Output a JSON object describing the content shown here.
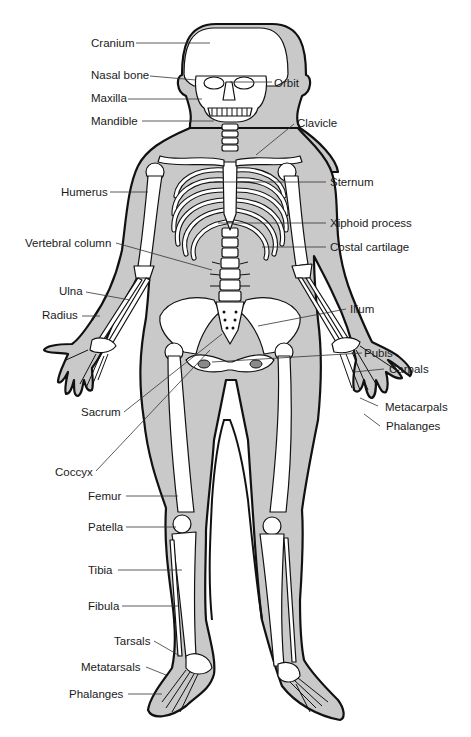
{
  "diagram": {
    "colors": {
      "body_fill": "#c9c9c9",
      "outline": "#111111",
      "bone": "#ffffff",
      "text": "#1a1a1a"
    },
    "labels": {
      "cranium": "Cranium",
      "nasal_bone": "Nasal bone",
      "orbit": "Orbit",
      "maxilla": "Maxilla",
      "mandible": "Mandible",
      "clavicle": "Clavicle",
      "humerus": "Humerus",
      "sternum": "Sternum",
      "xiphoid_process": "Xiphoid process",
      "vertebral_column": "Vertebral column",
      "costal_cartilage": "Costal cartilage",
      "ulna": "Ulna",
      "radius": "Radius",
      "ilium": "Ilium",
      "pubis": "Pubis",
      "carpals": "Carpals",
      "sacrum": "Sacrum",
      "metacarpals": "Metacarpals",
      "hand_phalanges": "Phalanges",
      "coccyx": "Coccyx",
      "femur": "Femur",
      "patella": "Patella",
      "tibia": "Tibia",
      "fibula": "Fibula",
      "tarsals": "Tarsals",
      "metatarsals": "Metatarsals",
      "foot_phalanges": "Phalanges"
    }
  }
}
